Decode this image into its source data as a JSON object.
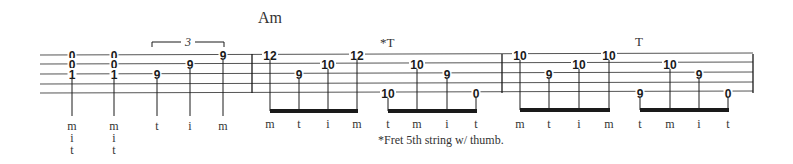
{
  "chord_name": "Am",
  "footnote": "*Fret 5th string w/ thumb.",
  "triplet_label": "3",
  "annotations": [
    {
      "text": "*T",
      "x": 380,
      "y": 47
    },
    {
      "text": "T",
      "x": 635,
      "y": 46
    }
  ],
  "colors": {
    "ink": "#1a1a1a",
    "staff": "#555555",
    "text": "#333333"
  },
  "staff": {
    "x_start": 40,
    "x_end": 753,
    "line_y": [
      55,
      64,
      74,
      84,
      93
    ],
    "barlines": [
      252,
      502,
      753
    ]
  },
  "measures": [
    {
      "index": 1,
      "notes": [
        {
          "x": 72,
          "frets": [
            {
              "string": 1,
              "fret": "0"
            },
            {
              "string": 2,
              "fret": "0"
            },
            {
              "string": 3,
              "fret": "1"
            }
          ],
          "fingers": [
            "m",
            "i",
            "t"
          ]
        },
        {
          "x": 114,
          "frets": [
            {
              "string": 1,
              "fret": "0"
            },
            {
              "string": 2,
              "fret": "0"
            },
            {
              "string": 3,
              "fret": "1"
            }
          ],
          "fingers": [
            "m",
            "i",
            "t"
          ]
        },
        {
          "x": 157,
          "frets": [
            {
              "string": 3,
              "fret": "9"
            }
          ],
          "fingers": [
            "t"
          ]
        },
        {
          "x": 190,
          "frets": [
            {
              "string": 2,
              "fret": "9"
            }
          ],
          "fingers": [
            "i"
          ]
        },
        {
          "x": 223,
          "frets": [
            {
              "string": 1,
              "fret": "9"
            }
          ],
          "fingers": [
            "m"
          ]
        }
      ],
      "triplet": {
        "x1": 152,
        "x2": 224,
        "y": 42
      }
    },
    {
      "index": 2,
      "chord": "Am",
      "groups": [
        {
          "beam_y": 111,
          "notes": [
            {
              "x": 270,
              "string": 1,
              "fret": "12",
              "finger": "m"
            },
            {
              "x": 299,
              "string": 3,
              "fret": "9",
              "finger": "t"
            },
            {
              "x": 328,
              "string": 2,
              "fret": "10",
              "finger": "i"
            },
            {
              "x": 357,
              "string": 1,
              "fret": "12",
              "finger": "m"
            }
          ]
        },
        {
          "beam_y": 111,
          "notes": [
            {
              "x": 388,
              "string": 5,
              "fret": "10",
              "finger": "t"
            },
            {
              "x": 417,
              "string": 2,
              "fret": "10",
              "finger": "m"
            },
            {
              "x": 447,
              "string": 3,
              "fret": "9",
              "finger": "i"
            },
            {
              "x": 476,
              "string": 5,
              "fret": "0",
              "finger": "t"
            }
          ]
        }
      ]
    },
    {
      "index": 3,
      "groups": [
        {
          "beam_y": 110,
          "notes": [
            {
              "x": 520,
              "string": 1,
              "fret": "10",
              "finger": "m"
            },
            {
              "x": 549,
              "string": 3,
              "fret": "9",
              "finger": "t"
            },
            {
              "x": 579,
              "string": 2,
              "fret": "10",
              "finger": "i"
            },
            {
              "x": 609,
              "string": 1,
              "fret": "10",
              "finger": "m"
            }
          ]
        },
        {
          "beam_y": 110,
          "notes": [
            {
              "x": 640,
              "string": 5,
              "fret": "9",
              "finger": "t"
            },
            {
              "x": 670,
              "string": 2,
              "fret": "10",
              "finger": "m"
            },
            {
              "x": 699,
              "string": 3,
              "fret": "9",
              "finger": "i"
            },
            {
              "x": 728,
              "string": 5,
              "fret": "0",
              "finger": "t"
            }
          ]
        }
      ]
    }
  ]
}
